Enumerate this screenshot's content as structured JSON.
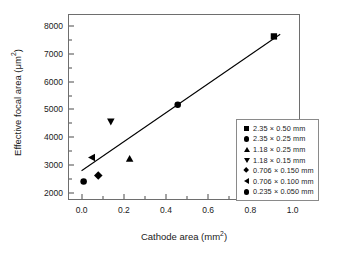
{
  "chart_data": {
    "type": "scatter",
    "title": "",
    "xlabel": "Cathode area (mm2)",
    "xlabel_base": "Cathode area (mm",
    "xlabel_sup": "2",
    "xlabel_tail": ")",
    "ylabel": "Effective focal area (um2)",
    "ylabel_base": "Effective focal area (μm",
    "ylabel_sup": "2",
    "ylabel_tail": ")",
    "xlim": [
      -0.06,
      1.04
    ],
    "ylim": [
      1700,
      8400
    ],
    "grid": false,
    "legend_position": "lower-right-inside",
    "xticks": [
      {
        "value": 0.0,
        "label": "0.0"
      },
      {
        "value": 0.2,
        "label": "0.2"
      },
      {
        "value": 0.4,
        "label": "0.4"
      },
      {
        "value": 0.6,
        "label": "0.6"
      },
      {
        "value": 0.8,
        "label": "0.8"
      },
      {
        "value": 1.0,
        "label": "1.0"
      }
    ],
    "xticks_minor": [
      0.1,
      0.3,
      0.5,
      0.7,
      0.9
    ],
    "yticks": [
      {
        "value": 2000,
        "label": "2000"
      },
      {
        "value": 3000,
        "label": "3000"
      },
      {
        "value": 4000,
        "label": "4000"
      },
      {
        "value": 5000,
        "label": "5000"
      },
      {
        "value": 6000,
        "label": "6000"
      },
      {
        "value": 7000,
        "label": "7000"
      },
      {
        "value": 8000,
        "label": "8000"
      }
    ],
    "yticks_minor": [
      2500,
      3500,
      4500,
      5500,
      6500,
      7500
    ],
    "marker_color": "#000000",
    "line_color": "#000000",
    "trendline": {
      "x": [
        0.0,
        0.95
      ],
      "y": [
        2730,
        7700
      ]
    },
    "series": [
      {
        "name": "2.35 × 0.50 mm",
        "marker": "square",
        "x": 0.92,
        "y": 7620
      },
      {
        "name": "2.35 × 0.25 mm",
        "marker": "circle",
        "x": 0.46,
        "y": 5130
      },
      {
        "name": "1.18 × 0.25 mm",
        "marker": "tri-up",
        "x": 0.23,
        "y": 3160
      },
      {
        "name": "1.18 × 0.15 mm",
        "marker": "tri-down",
        "x": 0.14,
        "y": 4520
      },
      {
        "name": "0.706 × 0.150 mm",
        "marker": "diamond",
        "x": 0.08,
        "y": 2560
      },
      {
        "name": "0.706 × 0.100 mm",
        "marker": "tri-left",
        "x": 0.05,
        "y": 3210
      },
      {
        "name": "0.235 × 0.050 mm",
        "marker": "circle",
        "x": 0.01,
        "y": 2340
      }
    ]
  }
}
